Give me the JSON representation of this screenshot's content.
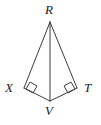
{
  "figure": {
    "background_color": "#ffffff",
    "stroke_color": "#3c3c42",
    "label_color": "#1a1a1a",
    "stroke_width": 1,
    "vertices": [
      {
        "id": "R",
        "label": "R",
        "x": 50,
        "y": 22,
        "label_x": 45,
        "label_y": 3
      },
      {
        "id": "X",
        "label": "X",
        "x": 24,
        "y": 88,
        "label_x": 5,
        "label_y": 81
      },
      {
        "id": "T",
        "label": "T",
        "x": 77,
        "y": 88,
        "label_x": 84,
        "label_y": 81
      },
      {
        "id": "V",
        "label": "V",
        "x": 50,
        "y": 101,
        "label_x": 45,
        "label_y": 104
      }
    ],
    "segments": [
      {
        "id": "RX",
        "from": "R",
        "to": "X"
      },
      {
        "id": "RT",
        "from": "R",
        "to": "T"
      },
      {
        "id": "RV",
        "from": "R",
        "to": "V",
        "role": "diagonal"
      },
      {
        "id": "XV",
        "from": "X",
        "to": "V"
      },
      {
        "id": "TV",
        "from": "T",
        "to": "V"
      }
    ],
    "right_angle_markers": [
      {
        "id": "angle-X",
        "at_vertex": "X",
        "size": 9,
        "points": "30,82 37,86 33,93 26,89"
      },
      {
        "id": "angle-T",
        "at_vertex": "T",
        "size": 9,
        "points": "71,82 64,86 68,93 75,89"
      }
    ]
  }
}
